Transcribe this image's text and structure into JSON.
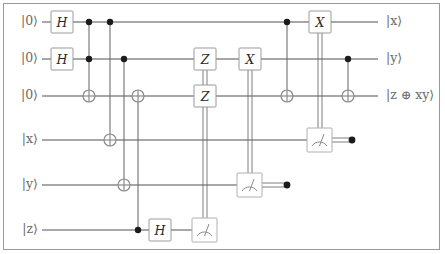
{
  "figure": {
    "type": "quantum-circuit-diagram",
    "border_color": "#9a9a9a",
    "wire_color": "#8a8a8a",
    "dot_color": "#1b1b1b",
    "gate_text_color": "#2a2a2a"
  },
  "wires": [
    {
      "id": "a0",
      "input_label": "|0⟩",
      "output_label": "|x⟩",
      "y": 22
    },
    {
      "id": "a1",
      "input_label": "|0⟩",
      "output_label": "|y⟩",
      "y": 59
    },
    {
      "id": "a2",
      "input_label": "|0⟩",
      "output_label": "|z ⊕ xy⟩",
      "y": 96
    },
    {
      "id": "x",
      "input_label": "|x⟩",
      "output_label": "",
      "y": 140
    },
    {
      "id": "y",
      "input_label": "|y⟩",
      "output_label": "",
      "y": 185
    },
    {
      "id": "z",
      "input_label": "|z⟩",
      "output_label": "",
      "y": 230
    }
  ],
  "gates": [
    {
      "name": "hadamard",
      "label": "H",
      "wire": "a0",
      "x": 62
    },
    {
      "name": "hadamard",
      "label": "H",
      "wire": "a1",
      "x": 62
    },
    {
      "name": "toffoli-target",
      "label": "⊕",
      "wire": "a2",
      "x": 89,
      "controls": [
        "a0",
        "a1"
      ]
    },
    {
      "name": "cnot-target",
      "label": "⊕",
      "wire": "x",
      "x": 110,
      "controls": [
        "a0"
      ]
    },
    {
      "name": "cnot-target",
      "label": "⊕",
      "wire": "y",
      "x": 124,
      "controls": [
        "a1"
      ]
    },
    {
      "name": "cnot-target",
      "label": "⊕",
      "wire": "a2",
      "x": 138,
      "controls": [
        "z"
      ]
    },
    {
      "name": "hadamard",
      "label": "H",
      "wire": "z",
      "x": 160
    },
    {
      "name": "measure",
      "label": "meter",
      "wire": "z",
      "x": 205
    },
    {
      "name": "pauli-z",
      "label": "Z",
      "wire": "a1",
      "x": 205,
      "classical_control_from": "z-measure"
    },
    {
      "name": "pauli-z",
      "label": "Z",
      "wire": "a2",
      "x": 205,
      "classical_control_from": "z-measure"
    },
    {
      "name": "measure",
      "label": "meter",
      "wire": "y",
      "x": 250
    },
    {
      "name": "pauli-x",
      "label": "X",
      "wire": "a1",
      "x": 250,
      "classical_control_from": "y-measure"
    },
    {
      "name": "cnot-target",
      "label": "⊕",
      "wire": "a2",
      "x": 287,
      "controls": [
        "a0"
      ]
    },
    {
      "name": "measure",
      "label": "meter",
      "wire": "x",
      "x": 320
    },
    {
      "name": "pauli-x",
      "label": "X",
      "wire": "a0",
      "x": 320,
      "classical_control_from": "x-measure"
    },
    {
      "name": "cnot-target",
      "label": "⊕",
      "wire": "a2",
      "x": 348,
      "controls": [
        "a1"
      ]
    }
  ],
  "legend": {
    "hadamard": "H",
    "pauli_x": "X",
    "pauli_z": "Z",
    "target": "⊕",
    "measure": "meter-icon"
  }
}
